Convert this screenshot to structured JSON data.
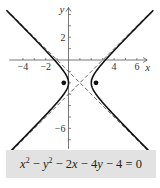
{
  "chart_data": {
    "type": "line",
    "title": "",
    "equation": "x² − y² − 2x − 4y − 4 = 0",
    "standard_form": "(x−1)² − (y+2)² = 1",
    "xlabel": "x",
    "ylabel": "y",
    "xlim": [
      -5,
      7
    ],
    "ylim": [
      -8,
      5
    ],
    "x_ticks": [
      -4,
      -3,
      -2,
      -1,
      0,
      1,
      2,
      3,
      4,
      5,
      6
    ],
    "x_tick_labels": [
      "−4",
      "−2",
      "4",
      "6"
    ],
    "x_tick_label_values": [
      -4,
      -2,
      4,
      6
    ],
    "y_tick_labels": [
      "2",
      "−6"
    ],
    "y_tick_label_values": [
      2,
      -6
    ],
    "center": [
      1,
      -2
    ],
    "vertices": [
      [
        0,
        -2
      ],
      [
        2,
        -2
      ]
    ],
    "foci": [
      [
        -0.414,
        -2
      ],
      [
        2.414,
        -2
      ]
    ],
    "asymptotes": [
      "y + 2 = x − 1",
      "y + 2 = −(x − 1)"
    ],
    "grid": false,
    "series": [
      {
        "name": "hyperbola",
        "style": "solid"
      },
      {
        "name": "asymptotes",
        "style": "dashed"
      },
      {
        "name": "foci",
        "style": "points"
      }
    ]
  },
  "caption": {
    "x": "x",
    "sup2": "2",
    "y": "y",
    "rest1": " − 2",
    "rest2": " − 4",
    "rest3": " − 4 = 0"
  },
  "labels": {
    "x_axis": "x",
    "y_axis": "y"
  }
}
